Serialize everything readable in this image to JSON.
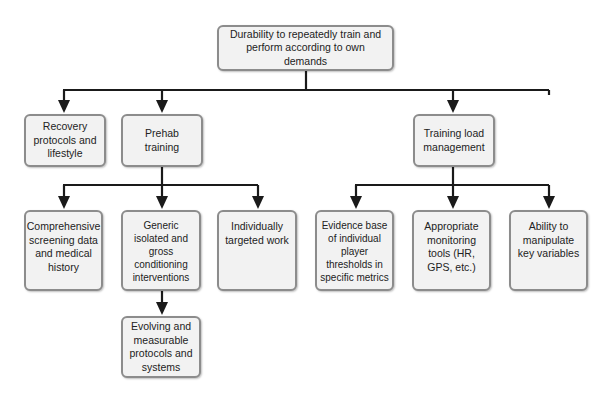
{
  "diagram": {
    "type": "hierarchy-tree",
    "colors": {
      "box_fill": "#f2f2f2",
      "box_border": "#8c8c8c",
      "connector": "#1a1a1a",
      "text": "#222222"
    },
    "root": {
      "id": "durability",
      "label": "Durability to repeatedly train and perform according to own demands"
    },
    "level1": [
      {
        "id": "recovery",
        "label": "Recovery protocols and lifestyle"
      },
      {
        "id": "prehab",
        "label": "Prehab training"
      },
      {
        "id": "training-load",
        "label": "Training load management"
      }
    ],
    "prehab_children": [
      {
        "id": "screening",
        "label": "Comprehensive screening data and medical history"
      },
      {
        "id": "generic",
        "label": "Generic isolated and gross conditioning interventions"
      },
      {
        "id": "individual",
        "label": "Individually targeted work"
      }
    ],
    "generic_children": [
      {
        "id": "evolving",
        "label": "Evolving and measurable protocols and systems"
      }
    ],
    "training_load_children": [
      {
        "id": "evidence",
        "label": "Evidence base of individual player thresholds in specific metrics"
      },
      {
        "id": "monitoring",
        "label": "Appropriate monitoring tools (HR, GPS, etc.)"
      },
      {
        "id": "manipulate",
        "label": "Ability to manipulate key variables"
      }
    ],
    "edges": [
      [
        "durability",
        "recovery"
      ],
      [
        "durability",
        "prehab"
      ],
      [
        "durability",
        "training-load"
      ],
      [
        "prehab",
        "screening"
      ],
      [
        "prehab",
        "generic"
      ],
      [
        "prehab",
        "individual"
      ],
      [
        "generic",
        "evolving"
      ],
      [
        "training-load",
        "evidence"
      ],
      [
        "training-load",
        "monitoring"
      ],
      [
        "training-load",
        "manipulate"
      ]
    ]
  }
}
